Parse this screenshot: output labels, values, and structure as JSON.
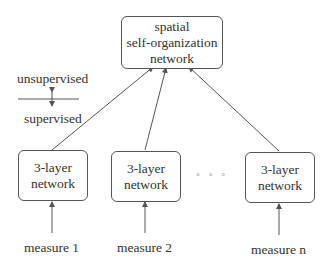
{
  "top_node": {
    "lines": [
      "spatial",
      "self-organization",
      "network"
    ]
  },
  "legend": {
    "upper": "unsupervised",
    "lower": "supervised"
  },
  "nodes": [
    {
      "lines": [
        "3-layer",
        "network"
      ],
      "input": "measure 1"
    },
    {
      "lines": [
        "3-layer",
        "network"
      ],
      "input": "measure 2"
    },
    {
      "lines": [
        "3-layer",
        "network"
      ],
      "input": "measure n"
    }
  ],
  "ellipsis": "◦ ◦ ◦",
  "colors": {
    "line": "#555555",
    "text": "#333333"
  }
}
